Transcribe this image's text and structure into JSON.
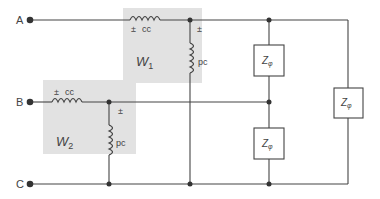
{
  "terminals": {
    "a": "A",
    "b": "B",
    "c": "C"
  },
  "wattmeter1": {
    "name": "W",
    "subscript": "1",
    "current_coil_label": "cc",
    "potential_coil_label": "pc",
    "polarity_mark_cc": "±",
    "polarity_mark_pc": "±"
  },
  "wattmeter2": {
    "name": "W",
    "subscript": "2",
    "current_coil_label": "cc",
    "potential_coil_label": "pc",
    "polarity_mark_cc": "±",
    "polarity_mark_pc": "±"
  },
  "loads": [
    {
      "label": "Z",
      "subscript": "φ"
    },
    {
      "label": "Z",
      "subscript": "φ"
    },
    {
      "label": "Z",
      "subscript": "φ"
    }
  ],
  "colors": {
    "wire": "#444444",
    "shade": "#e2e2e2",
    "box_fill": "#ffffff"
  }
}
